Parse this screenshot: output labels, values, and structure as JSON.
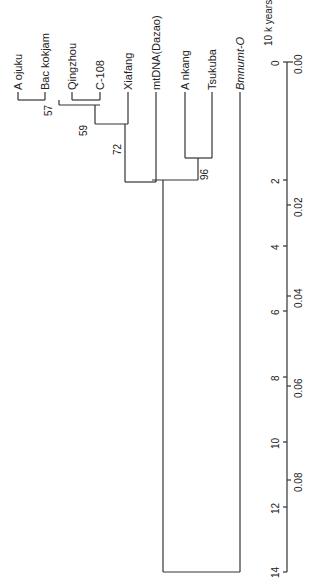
{
  "figure": {
    "type": "phylogenetic-tree",
    "orientation": "rotated-90",
    "taxa": [
      {
        "id": "aojuku",
        "label": "A ojuku"
      },
      {
        "id": "backokjam",
        "label": "Bac kokjam"
      },
      {
        "id": "qingzhou",
        "label": "Qingzhou"
      },
      {
        "id": "c108",
        "label": "C-108"
      },
      {
        "id": "xiafang",
        "label": "Xiafang"
      },
      {
        "id": "mtdna",
        "label": "mtDNA(Dazao)"
      },
      {
        "id": "ankang",
        "label": "A nkang"
      },
      {
        "id": "tsukuba",
        "label": "Tsukuba"
      },
      {
        "id": "bmnumt",
        "label": "Bmnumt-O"
      }
    ],
    "bootstrap": [
      {
        "value": "57"
      },
      {
        "value": "59"
      },
      {
        "value": "72"
      },
      {
        "value": "96"
      }
    ],
    "axis_time": {
      "title": "10 k years",
      "ticks": [
        "0",
        "2",
        "4",
        "6",
        "8",
        "10",
        "12",
        "14"
      ]
    },
    "axis_distance": {
      "ticks": [
        "0.00",
        "0.02",
        "0.04",
        "0.06",
        "0.08"
      ]
    }
  }
}
